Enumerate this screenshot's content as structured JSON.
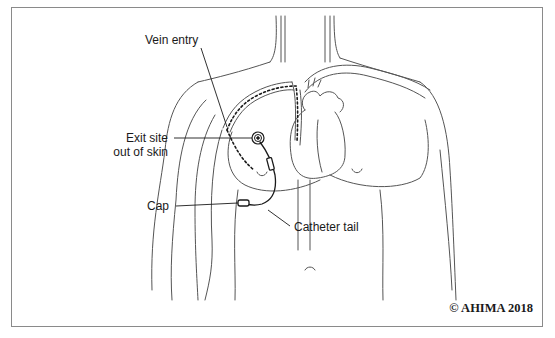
{
  "figure": {
    "labels": {
      "vein_entry": "Vein entry",
      "exit_site_line1": "Exit site",
      "exit_site_line2": "out of skin",
      "cap": "Cap",
      "catheter_tail": "Catheter tail"
    },
    "copyright": "© AHIMA 2018",
    "colors": {
      "line": "#2a2a2a",
      "body_outline": "#555555",
      "border": "#8a8a8a",
      "background": "#ffffff"
    }
  }
}
